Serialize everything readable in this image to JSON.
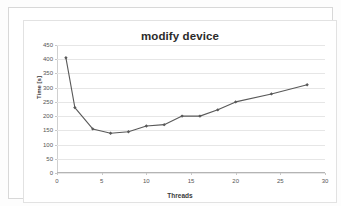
{
  "chart_data": {
    "type": "line",
    "title": "modify device",
    "xlabel": "Threads",
    "ylabel": "Time [s]",
    "x": [
      1,
      2,
      4,
      6,
      8,
      10,
      12,
      14,
      16,
      18,
      20,
      24,
      28
    ],
    "values": [
      405,
      230,
      155,
      140,
      145,
      165,
      170,
      200,
      200,
      222,
      250,
      278,
      310
    ],
    "series": [
      {
        "name": "modify device",
        "x": [
          1,
          2,
          4,
          6,
          8,
          10,
          12,
          14,
          16,
          18,
          20,
          24,
          28
        ],
        "values": [
          405,
          230,
          155,
          140,
          145,
          165,
          170,
          200,
          200,
          222,
          250,
          278,
          310
        ]
      }
    ],
    "xlim": [
      0,
      30
    ],
    "ylim": [
      0,
      450
    ],
    "xticks": [
      0,
      5,
      10,
      15,
      20,
      25,
      30
    ],
    "yticks": [
      0,
      50,
      100,
      150,
      200,
      250,
      300,
      350,
      400,
      450
    ],
    "xtick_labels": [
      "0",
      "5",
      "10",
      "15",
      "20",
      "25",
      "30"
    ],
    "ytick_labels": [
      "0",
      "50",
      "100",
      "150",
      "200",
      "250",
      "300",
      "350",
      "400",
      "450"
    ],
    "grid": "horizontal",
    "legend": "none",
    "line_color": "#595959",
    "marker": "diamond",
    "marker_color": "#595959"
  }
}
